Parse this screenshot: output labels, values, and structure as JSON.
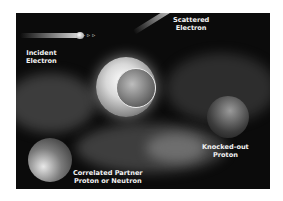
{
  "figure": {
    "labels": {
      "incident": [
        "Incident",
        "Electron"
      ],
      "scattered": [
        "Scattered",
        "Electron"
      ],
      "knocked_out": [
        "Knocked-out",
        "Proton"
      ],
      "partner": [
        "Correlated Partner",
        "Proton or Neutron"
      ]
    },
    "colors": {
      "background": "#0b0b0b",
      "text": "#f2f2f2",
      "page": "#ffffff"
    }
  }
}
